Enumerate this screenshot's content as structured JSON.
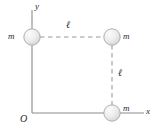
{
  "figure": {
    "type": "physics-diagram",
    "background_color": "#ffffff",
    "axis_color": "#8c8c8c",
    "dash_color": "#9a9a9a",
    "sphere_fill": "#ededed",
    "sphere_edge": "#a8a8a8",
    "text_color": "#2a2a2a",
    "axes": {
      "x_label": "x",
      "y_label": "y",
      "origin_label": "O"
    },
    "masses": [
      {
        "id": "mass-top-left",
        "label": "m",
        "x": 32,
        "y": 37,
        "label_x": 8,
        "label_y": 32
      },
      {
        "id": "mass-top-right",
        "label": "m",
        "x": 112,
        "y": 37,
        "label_x": 123,
        "label_y": 32
      },
      {
        "id": "mass-bottom-right",
        "label": "m",
        "x": 112,
        "y": 113,
        "label_x": 123,
        "label_y": 105
      }
    ],
    "dimensions": [
      {
        "id": "length-horizontal",
        "label": "ℓ",
        "label_x": 66,
        "label_y": 21
      },
      {
        "id": "length-vertical",
        "label": "ℓ",
        "label_x": 118,
        "label_y": 69
      }
    ]
  }
}
